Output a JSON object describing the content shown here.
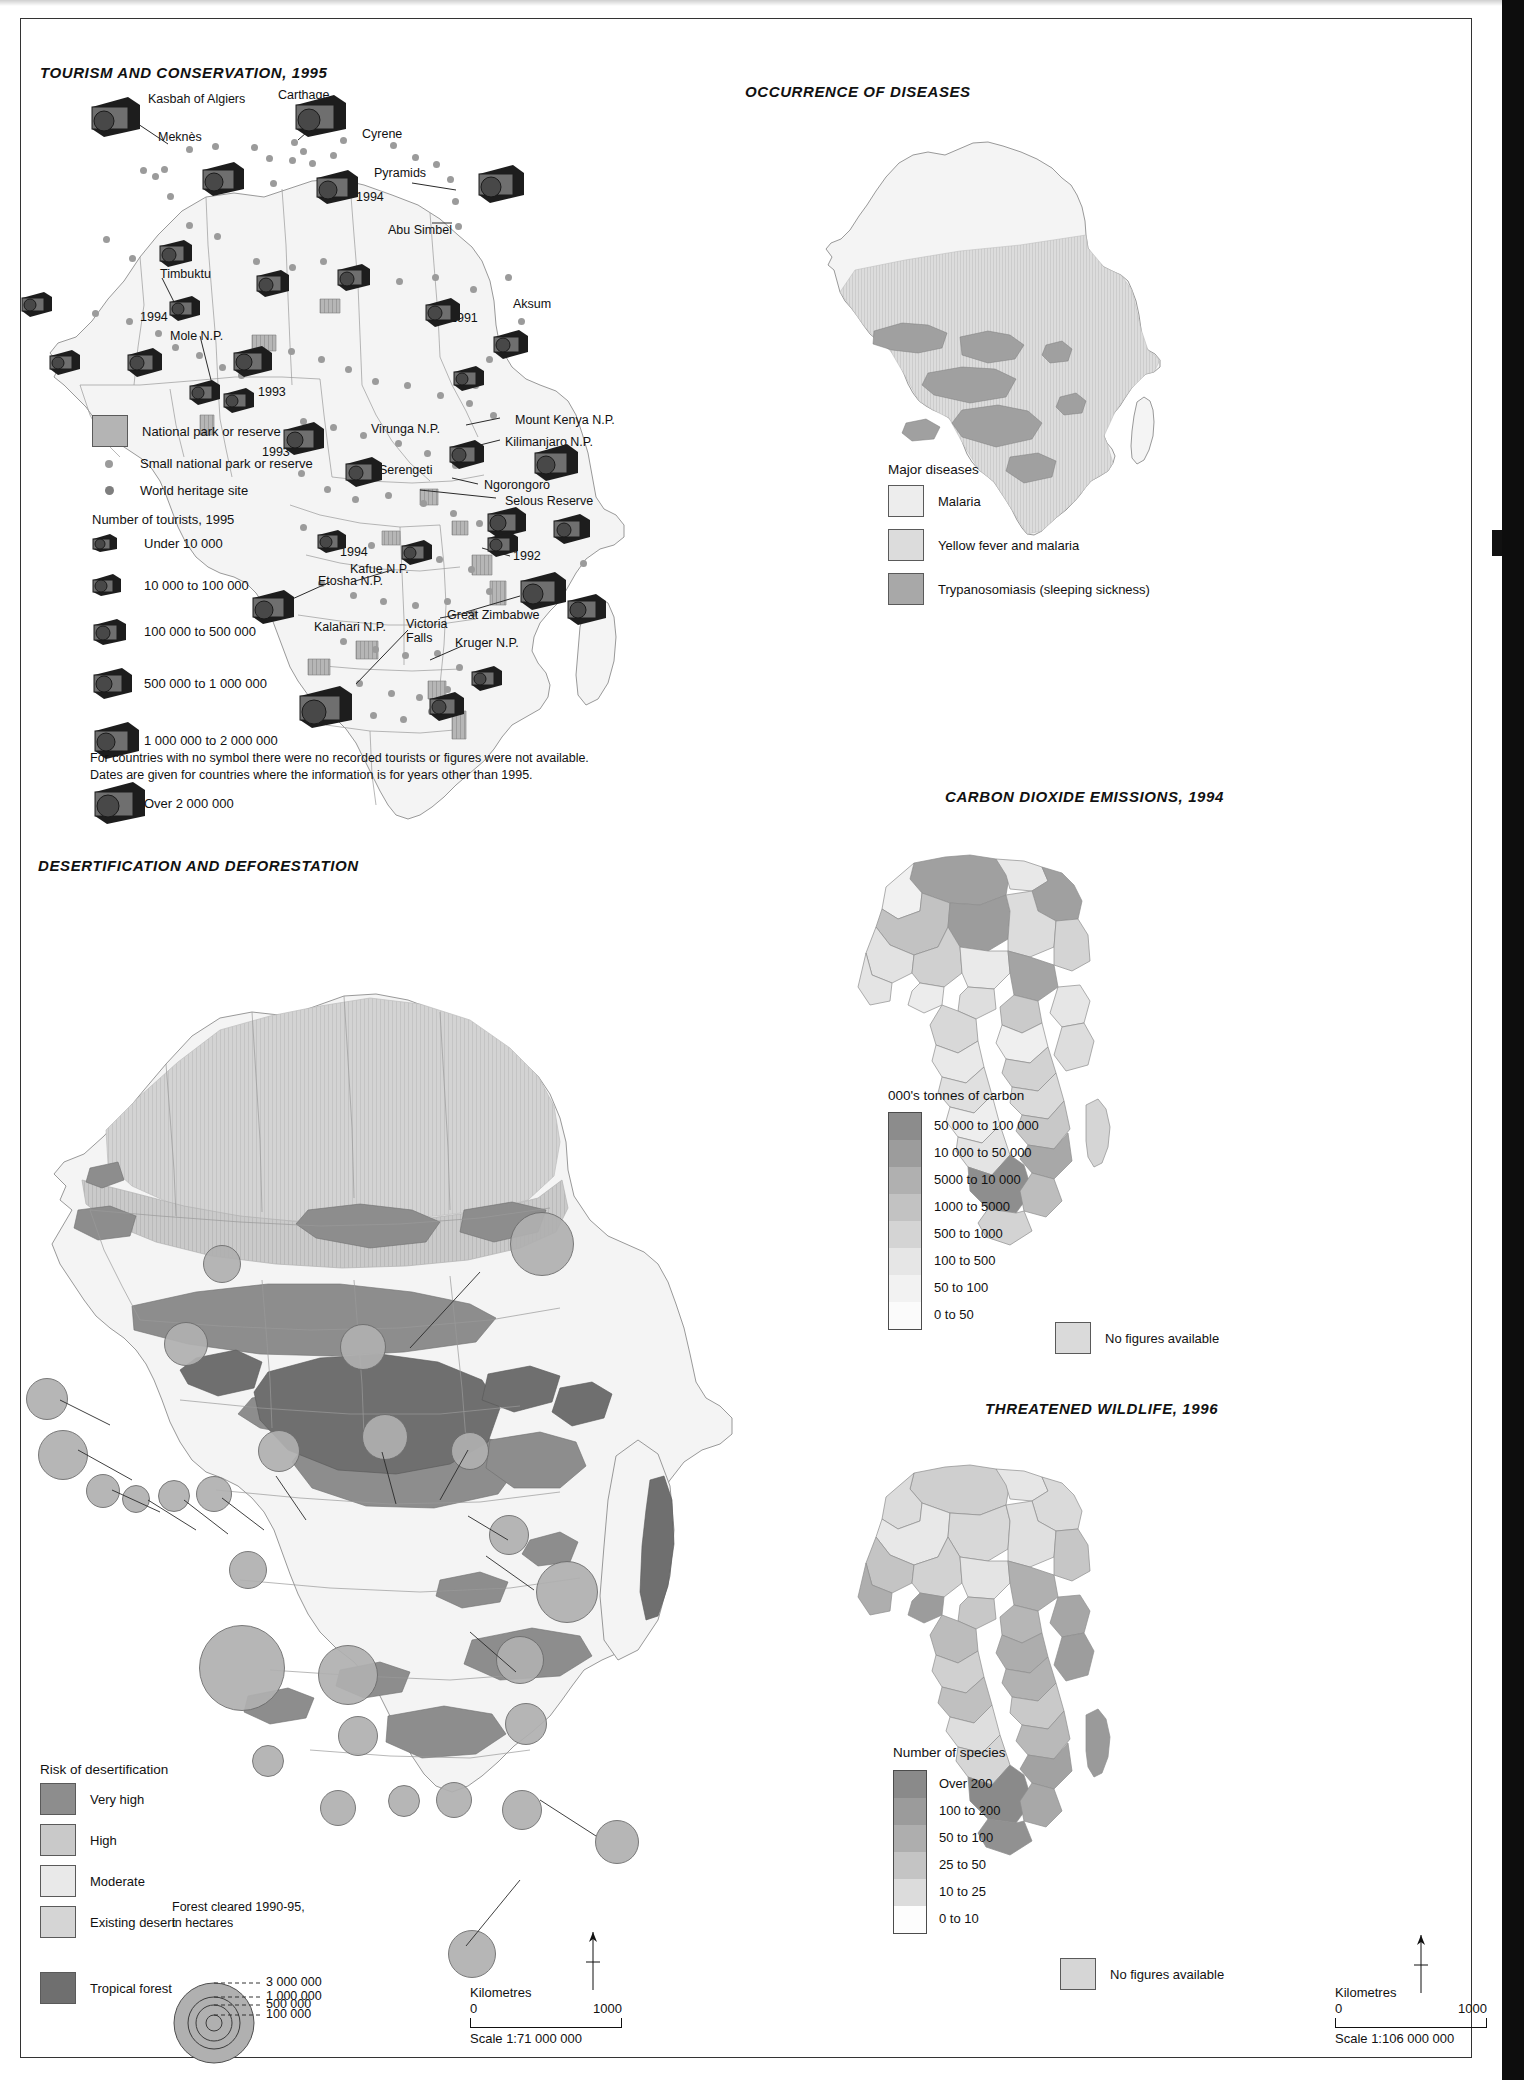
{
  "page": {
    "maps": [
      "tourism",
      "diseases",
      "desertification",
      "co2",
      "wildlife"
    ]
  },
  "tourism": {
    "title": "TOURISM AND CONSERVATION, 1995",
    "legend": {
      "park_label": "National park or reserve",
      "small_park_label": "Small national park or reserve",
      "heritage_label": "World heritage site",
      "tourists_head": "Number of tourists, 1995",
      "classes": [
        "Under 10 000",
        "10 000 to 100 000",
        "100 000 to 500 000",
        "500 000 to 1 000 000",
        "1 000 000 to 2 000 000",
        "Over 2 000 000"
      ]
    },
    "note_line1": "For countries with no symbol there were no recorded tourists or figures were not available.",
    "note_line2": "Dates are given for countries where the information is for years other than 1995.",
    "places": [
      {
        "name": "Kasbah of Algiers",
        "x": 148,
        "y": 92
      },
      {
        "name": "Carthage",
        "x": 278,
        "y": 88
      },
      {
        "name": "Meknès",
        "x": 158,
        "y": 130
      },
      {
        "name": "Cyrene",
        "x": 362,
        "y": 127
      },
      {
        "name": "Pyramids",
        "x": 374,
        "y": 166
      },
      {
        "name": "Abu Simbel",
        "x": 388,
        "y": 223
      },
      {
        "name": "Timbuktu",
        "x": 160,
        "y": 267
      },
      {
        "name": "Mole N.P.",
        "x": 170,
        "y": 329
      },
      {
        "name": "Aksum",
        "x": 513,
        "y": 297
      },
      {
        "name": "Virunga N.P.",
        "x": 371,
        "y": 422
      },
      {
        "name": "Mount Kenya N.P.",
        "x": 515,
        "y": 413
      },
      {
        "name": "Kilimanjaro N.P.",
        "x": 505,
        "y": 435
      },
      {
        "name": "Serengeti",
        "x": 379,
        "y": 463
      },
      {
        "name": "Ngorongoro",
        "x": 484,
        "y": 478
      },
      {
        "name": "Selous Reserve",
        "x": 505,
        "y": 494
      },
      {
        "name": "Kafue N.P.",
        "x": 350,
        "y": 562
      },
      {
        "name": "Etosha N.P.",
        "x": 318,
        "y": 574
      },
      {
        "name": "Kalahari N.P.",
        "x": 314,
        "y": 620
      },
      {
        "name": "Victoria Falls",
        "x": 408,
        "y": 618
      },
      {
        "name": "Great Zimbabwe",
        "x": 447,
        "y": 608
      },
      {
        "name": "Kruger N.P.",
        "x": 455,
        "y": 636
      }
    ],
    "years": [
      {
        "value": "1994",
        "x": 356,
        "y": 190
      },
      {
        "value": "1994",
        "x": 140,
        "y": 310
      },
      {
        "value": "1991",
        "x": 450,
        "y": 311
      },
      {
        "value": "1993",
        "x": 258,
        "y": 385
      },
      {
        "value": "1993",
        "x": 262,
        "y": 445
      },
      {
        "value": "1994",
        "x": 340,
        "y": 545
      },
      {
        "value": "1992",
        "x": 513,
        "y": 549
      }
    ]
  },
  "diseases": {
    "title": "OCCURRENCE OF DISEASES",
    "legend": {
      "head": "Major diseases",
      "items": [
        {
          "label": "Malaria",
          "color": "#ededed"
        },
        {
          "label": "Yellow fever and malaria",
          "color": "#dcdcdc"
        },
        {
          "label": "Trypanosomiasis (sleeping sickness)",
          "color": "#a8a8a8"
        }
      ]
    }
  },
  "co2": {
    "title": "CARBON DIOXIDE EMISSIONS, 1994",
    "legend": {
      "head": "000's tonnes of carbon",
      "classes": [
        {
          "label": "50 000 to 100 000",
          "color": "#8c8c8c"
        },
        {
          "label": "10 000 to 50 000",
          "color": "#9c9c9c"
        },
        {
          "label": "5000 to 10 000",
          "color": "#b0b0b0"
        },
        {
          "label": "1000 to 5000",
          "color": "#c2c2c2"
        },
        {
          "label": "500 to 1000",
          "color": "#d4d4d4"
        },
        {
          "label": "100 to 500",
          "color": "#e6e6e6"
        },
        {
          "label": "50 to 100",
          "color": "#f2f2f2"
        },
        {
          "label": "0 to 50",
          "color": "#fbfbfb"
        }
      ],
      "nofigures": {
        "label": "No figures available",
        "color": "#dadada"
      }
    }
  },
  "wildlife": {
    "title": "THREATENED WILDLIFE, 1996",
    "legend": {
      "head": "Number of species",
      "classes": [
        {
          "label": "Over 200",
          "color": "#8a8a8a"
        },
        {
          "label": "100 to 200",
          "color": "#9b9b9b"
        },
        {
          "label": "50 to 100",
          "color": "#aeaeae"
        },
        {
          "label": "25 to 50",
          "color": "#c4c4c4"
        },
        {
          "label": "10 to 25",
          "color": "#dcdcdc"
        },
        {
          "label": "0 to 10",
          "color": "#fdfdfd"
        }
      ],
      "nofigures": {
        "label": "No figures available",
        "color": "#d6d6d6"
      }
    },
    "scale": {
      "km_label": "Kilometres",
      "zero": "0",
      "max": "1000",
      "ratio": "Scale 1:106 000 000"
    }
  },
  "desertification": {
    "title": "DESERTIFICATION AND DEFORESTATION",
    "legend": {
      "head": "Risk of desertification",
      "classes": [
        {
          "label": "Very high",
          "color": "#8d8d8d"
        },
        {
          "label": "High",
          "color": "#c9c9c9"
        },
        {
          "label": "Moderate",
          "color": "#e4e4e4"
        },
        {
          "label": "Existing desert",
          "color": "#d3d3d3"
        }
      ],
      "forest": {
        "label": "Tropical forest",
        "color": "#7e7e7e"
      }
    },
    "forest_cleared": {
      "head_line1": "Forest cleared 1990-95,",
      "head_line2": "in hectares",
      "values": [
        "3 000 000",
        "1 000 000",
        "500 000",
        "100 000"
      ]
    },
    "scale": {
      "km_label": "Kilometres",
      "zero": "0",
      "max": "1000",
      "ratio": "Scale 1:71 000 000"
    }
  }
}
